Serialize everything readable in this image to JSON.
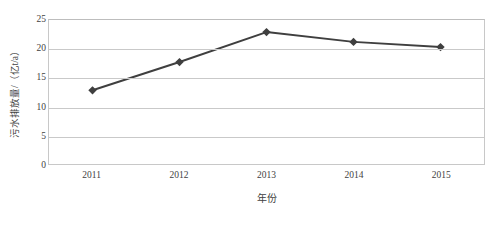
{
  "chart_data": {
    "type": "line",
    "title": "",
    "subtitle": "",
    "xlabel": "年份",
    "ylabel": "污水排放量/（亿t/a）",
    "categories": [
      "2011",
      "2012",
      "2013",
      "2014",
      "2015"
    ],
    "x": [
      2011,
      2012,
      2013,
      2014,
      2015
    ],
    "series": [
      {
        "name": "污水排放量",
        "values": [
          12.8,
          17.7,
          22.9,
          21.2,
          20.3
        ]
      }
    ],
    "ylim": [
      0,
      25
    ],
    "ytick_labels": [
      "0",
      "5",
      "10",
      "15",
      "20",
      "25"
    ],
    "ytick_values": [
      0,
      5,
      10,
      15,
      20,
      25
    ],
    "grid": "horizontal",
    "legend": "none",
    "annotations": [],
    "colors": {
      "line": "#3f3f3f",
      "marker": "#3f3f3f",
      "gridline": "#c9c9c9",
      "plot_border": "#c8c8c8",
      "text": "#3f3f3f",
      "background": "#ffffff"
    },
    "marker_shape": "diamond",
    "line_width": 2
  }
}
